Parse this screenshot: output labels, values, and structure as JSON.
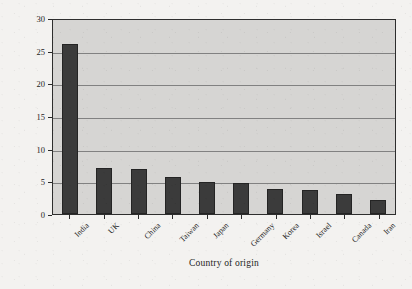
{
  "chart_data": {
    "type": "bar",
    "title": "",
    "xlabel": "Country of origin",
    "ylabel": "Percentage of founders",
    "categories": [
      "India",
      "UK",
      "China",
      "Taiwan",
      "Japan",
      "Germany",
      "Korea",
      "Israel",
      "Canada",
      "Iran"
    ],
    "values": [
      26,
      7,
      6.9,
      5.7,
      4.9,
      4.8,
      3.9,
      3.7,
      3.1,
      2.1
    ],
    "ylim": [
      0,
      30
    ],
    "yticks": [
      0,
      5,
      10,
      15,
      20,
      25,
      30
    ],
    "ytick_labels": [
      "0",
      "5",
      "10",
      "15",
      "20",
      "25",
      "30"
    ],
    "grid": true,
    "legend": false,
    "legend_position": "none",
    "bar_color": "#3b3b3b",
    "plot_background": "#d6d5d3",
    "gridline_color": "#818181",
    "axis_color": "#2e2e2e",
    "figure_background": "#f3f2f0",
    "xtick_label_rotation": -45
  },
  "axes": {
    "y_title": "Percentage of founders",
    "x_title": "Country of origin"
  }
}
